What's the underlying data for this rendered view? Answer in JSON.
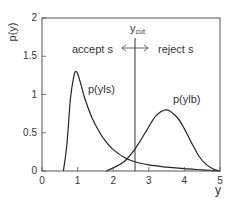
{
  "chart_data": {
    "type": "line",
    "title": "",
    "xlabel": "y",
    "ylabel": "p(y)",
    "xlim": [
      0,
      5
    ],
    "ylim": [
      0,
      2
    ],
    "xticks": [
      "0",
      "1",
      "2",
      "3",
      "4",
      "5"
    ],
    "yticks": [
      "0",
      "0.5",
      "1",
      "1.5",
      "2"
    ],
    "grid": false,
    "legend": "none (inline curve labels)",
    "series": [
      {
        "name": "p(y|s)",
        "label": "p(yls)",
        "x": [
          0.6,
          0.7,
          0.8,
          0.9,
          0.95,
          1.0,
          1.1,
          1.2,
          1.4,
          1.6,
          1.8,
          2.0,
          2.3,
          2.6,
          3.0,
          3.5,
          4.0,
          4.5,
          5.0
        ],
        "values": [
          0.0,
          0.35,
          0.95,
          1.25,
          1.3,
          1.27,
          1.12,
          0.95,
          0.7,
          0.52,
          0.38,
          0.28,
          0.18,
          0.12,
          0.08,
          0.05,
          0.03,
          0.015,
          0.0
        ]
      },
      {
        "name": "p(y|b)",
        "label": "p(ylb)",
        "x": [
          1.8,
          2.0,
          2.3,
          2.6,
          2.9,
          3.2,
          3.5,
          3.8,
          4.0,
          4.2,
          4.4,
          4.6,
          4.8,
          5.0
        ],
        "values": [
          0.0,
          0.04,
          0.12,
          0.28,
          0.5,
          0.72,
          0.8,
          0.7,
          0.55,
          0.37,
          0.2,
          0.09,
          0.03,
          0.0
        ]
      }
    ],
    "annotations": [
      {
        "type": "vline",
        "x": 2.6,
        "label": "y",
        "subscript": "cut"
      },
      {
        "type": "double-arrow",
        "x": 2.6,
        "y": 1.6
      },
      {
        "type": "text",
        "text": "accept s",
        "x": 1.3,
        "y": 1.55
      },
      {
        "type": "text",
        "text": "reject s",
        "x": 3.4,
        "y": 1.55
      }
    ]
  },
  "labels": {
    "ylabel": "p(y)",
    "xlabel": "y",
    "accept": "accept s",
    "reject": "reject s",
    "ycut_main": "y",
    "ycut_sub": "cut",
    "sig_curve": "p(yls)",
    "bkg_curve": "p(ylb)"
  }
}
